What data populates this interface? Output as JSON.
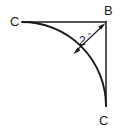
{
  "diagram": {
    "background_color": "#ffffff",
    "stroke_color": "#1a1a1a",
    "vertex_labels": {
      "corner": "B",
      "tangent_left": "C",
      "tangent_bottom": "C"
    },
    "dimension": {
      "value": "2",
      "unit": "″",
      "full_text": "2″",
      "description": "radius"
    },
    "geometry": {
      "corner_point": [
        106,
        22
      ],
      "tangent_left_point": [
        22,
        22
      ],
      "tangent_bottom_point": [
        106,
        106
      ],
      "radius_px": 84,
      "arc_sweep_degrees": 90,
      "leader_from": [
        74,
        52
      ],
      "leader_to": [
        104,
        24
      ]
    }
  }
}
